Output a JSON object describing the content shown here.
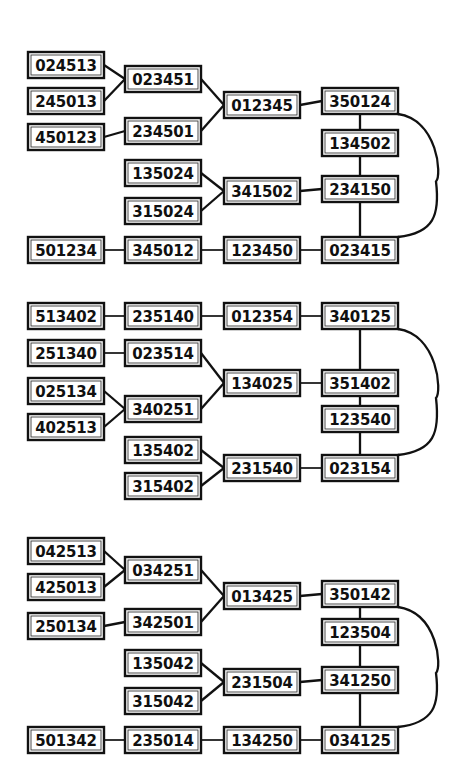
{
  "figure": {
    "diagram_count": 3,
    "canvas": {
      "width": 457,
      "height": 767
    },
    "colors": {
      "background": "#ffffff",
      "box_stroke": "#111111",
      "box_fill": "#ffffff",
      "text": "#101010",
      "edge": "#111111"
    },
    "box_size": {
      "width": 76,
      "height": 26
    },
    "columns": {
      "c1": 28,
      "c2": 125,
      "c3": 224,
      "c4": 322
    }
  },
  "diagrams": [
    {
      "id": "diagram-1",
      "nodes": [
        {
          "id": "d1n1",
          "label": "024513",
          "x": 28,
          "y": 52
        },
        {
          "id": "d1n2",
          "label": "245013",
          "x": 28,
          "y": 88
        },
        {
          "id": "d1n3",
          "label": "450123",
          "x": 28,
          "y": 124
        },
        {
          "id": "d1n4",
          "label": "023451",
          "x": 125,
          "y": 66
        },
        {
          "id": "d1n5",
          "label": "234501",
          "x": 125,
          "y": 118
        },
        {
          "id": "d1n6",
          "label": "012345",
          "x": 224,
          "y": 92
        },
        {
          "id": "d1n7",
          "label": "350124",
          "x": 322,
          "y": 88
        },
        {
          "id": "d1n8",
          "label": "134502",
          "x": 322,
          "y": 130
        },
        {
          "id": "d1n9",
          "label": "135024",
          "x": 125,
          "y": 160
        },
        {
          "id": "d1n10",
          "label": "315024",
          "x": 125,
          "y": 198
        },
        {
          "id": "d1n11",
          "label": "341502",
          "x": 224,
          "y": 178
        },
        {
          "id": "d1n12",
          "label": "234150",
          "x": 322,
          "y": 176
        },
        {
          "id": "d1n13",
          "label": "501234",
          "x": 28,
          "y": 237
        },
        {
          "id": "d1n14",
          "label": "345012",
          "x": 125,
          "y": 237
        },
        {
          "id": "d1n15",
          "label": "123450",
          "x": 224,
          "y": 237
        },
        {
          "id": "d1n16",
          "label": "023415",
          "x": 322,
          "y": 237
        }
      ],
      "edges": [
        {
          "from": "d1n1",
          "to": "d1n4",
          "kind": "straight"
        },
        {
          "from": "d1n2",
          "to": "d1n4",
          "kind": "straight"
        },
        {
          "from": "d1n3",
          "to": "d1n5",
          "kind": "straight"
        },
        {
          "from": "d1n4",
          "to": "d1n6",
          "kind": "straight"
        },
        {
          "from": "d1n5",
          "to": "d1n6",
          "kind": "straight"
        },
        {
          "from": "d1n6",
          "to": "d1n7",
          "kind": "straight"
        },
        {
          "from": "d1n7",
          "to": "d1n8",
          "kind": "vertical"
        },
        {
          "from": "d1n8",
          "to": "d1n12",
          "kind": "vertical"
        },
        {
          "from": "d1n9",
          "to": "d1n11",
          "kind": "straight"
        },
        {
          "from": "d1n10",
          "to": "d1n11",
          "kind": "straight"
        },
        {
          "from": "d1n11",
          "to": "d1n12",
          "kind": "straight"
        },
        {
          "from": "d1n12",
          "to": "d1n16",
          "kind": "vertical"
        },
        {
          "from": "d1n13",
          "to": "d1n14",
          "kind": "straight"
        },
        {
          "from": "d1n14",
          "to": "d1n15",
          "kind": "straight"
        },
        {
          "from": "d1n15",
          "to": "d1n16",
          "kind": "straight"
        },
        {
          "from": "d1n7",
          "to": "d1n16",
          "kind": "arc",
          "bulge": 40
        }
      ]
    },
    {
      "id": "diagram-2",
      "nodes": [
        {
          "id": "d2n1",
          "label": "513402",
          "x": 28,
          "y": 303
        },
        {
          "id": "d2n2",
          "label": "235140",
          "x": 125,
          "y": 303
        },
        {
          "id": "d2n3",
          "label": "012354",
          "x": 224,
          "y": 303
        },
        {
          "id": "d2n4",
          "label": "340125",
          "x": 322,
          "y": 303
        },
        {
          "id": "d2n5",
          "label": "251340",
          "x": 28,
          "y": 340
        },
        {
          "id": "d2n6",
          "label": "023514",
          "x": 125,
          "y": 340
        },
        {
          "id": "d2n7",
          "label": "025134",
          "x": 28,
          "y": 378
        },
        {
          "id": "d2n8",
          "label": "402513",
          "x": 28,
          "y": 414
        },
        {
          "id": "d2n9",
          "label": "340251",
          "x": 125,
          "y": 396
        },
        {
          "id": "d2n10",
          "label": "134025",
          "x": 224,
          "y": 370
        },
        {
          "id": "d2n11",
          "label": "351402",
          "x": 322,
          "y": 370
        },
        {
          "id": "d2n12",
          "label": "123540",
          "x": 322,
          "y": 406
        },
        {
          "id": "d2n13",
          "label": "135402",
          "x": 125,
          "y": 437
        },
        {
          "id": "d2n14",
          "label": "315402",
          "x": 125,
          "y": 473
        },
        {
          "id": "d2n15",
          "label": "231540",
          "x": 224,
          "y": 455
        },
        {
          "id": "d2n16",
          "label": "023154",
          "x": 322,
          "y": 455
        }
      ],
      "edges": [
        {
          "from": "d2n1",
          "to": "d2n2",
          "kind": "straight"
        },
        {
          "from": "d2n2",
          "to": "d2n3",
          "kind": "straight"
        },
        {
          "from": "d2n3",
          "to": "d2n4",
          "kind": "straight"
        },
        {
          "from": "d2n4",
          "to": "d2n11",
          "kind": "vertical"
        },
        {
          "from": "d2n5",
          "to": "d2n6",
          "kind": "straight"
        },
        {
          "from": "d2n6",
          "to": "d2n10",
          "kind": "straight"
        },
        {
          "from": "d2n7",
          "to": "d2n9",
          "kind": "straight"
        },
        {
          "from": "d2n8",
          "to": "d2n9",
          "kind": "straight"
        },
        {
          "from": "d2n9",
          "to": "d2n10",
          "kind": "straight"
        },
        {
          "from": "d2n10",
          "to": "d2n11",
          "kind": "straight"
        },
        {
          "from": "d2n11",
          "to": "d2n12",
          "kind": "vertical"
        },
        {
          "from": "d2n12",
          "to": "d2n16",
          "kind": "vertical"
        },
        {
          "from": "d2n13",
          "to": "d2n15",
          "kind": "straight"
        },
        {
          "from": "d2n14",
          "to": "d2n15",
          "kind": "straight"
        },
        {
          "from": "d2n15",
          "to": "d2n16",
          "kind": "straight"
        },
        {
          "from": "d2n4",
          "to": "d2n16",
          "kind": "arc",
          "bulge": 40
        }
      ]
    },
    {
      "id": "diagram-3",
      "nodes": [
        {
          "id": "d3n1",
          "label": "042513",
          "x": 28,
          "y": 538
        },
        {
          "id": "d3n2",
          "label": "425013",
          "x": 28,
          "y": 574
        },
        {
          "id": "d3n3",
          "label": "250134",
          "x": 28,
          "y": 613
        },
        {
          "id": "d3n4",
          "label": "034251",
          "x": 125,
          "y": 557
        },
        {
          "id": "d3n5",
          "label": "342501",
          "x": 125,
          "y": 609
        },
        {
          "id": "d3n6",
          "label": "013425",
          "x": 224,
          "y": 583
        },
        {
          "id": "d3n7",
          "label": "350142",
          "x": 322,
          "y": 581
        },
        {
          "id": "d3n8",
          "label": "123504",
          "x": 322,
          "y": 619
        },
        {
          "id": "d3n9",
          "label": "135042",
          "x": 125,
          "y": 650
        },
        {
          "id": "d3n10",
          "label": "315042",
          "x": 125,
          "y": 688
        },
        {
          "id": "d3n11",
          "label": "231504",
          "x": 224,
          "y": 669
        },
        {
          "id": "d3n12",
          "label": "341250",
          "x": 322,
          "y": 667
        },
        {
          "id": "d3n13",
          "label": "501342",
          "x": 28,
          "y": 727
        },
        {
          "id": "d3n14",
          "label": "235014",
          "x": 125,
          "y": 727
        },
        {
          "id": "d3n15",
          "label": "134250",
          "x": 224,
          "y": 727
        },
        {
          "id": "d3n16",
          "label": "034125",
          "x": 322,
          "y": 727
        }
      ],
      "edges": [
        {
          "from": "d3n1",
          "to": "d3n4",
          "kind": "straight"
        },
        {
          "from": "d3n2",
          "to": "d3n4",
          "kind": "straight"
        },
        {
          "from": "d3n3",
          "to": "d3n5",
          "kind": "straight"
        },
        {
          "from": "d3n4",
          "to": "d3n6",
          "kind": "straight"
        },
        {
          "from": "d3n5",
          "to": "d3n6",
          "kind": "straight"
        },
        {
          "from": "d3n6",
          "to": "d3n7",
          "kind": "straight"
        },
        {
          "from": "d3n7",
          "to": "d3n8",
          "kind": "vertical"
        },
        {
          "from": "d3n8",
          "to": "d3n12",
          "kind": "vertical"
        },
        {
          "from": "d3n9",
          "to": "d3n11",
          "kind": "straight"
        },
        {
          "from": "d3n10",
          "to": "d3n11",
          "kind": "straight"
        },
        {
          "from": "d3n11",
          "to": "d3n12",
          "kind": "straight"
        },
        {
          "from": "d3n12",
          "to": "d3n16",
          "kind": "vertical"
        },
        {
          "from": "d3n13",
          "to": "d3n14",
          "kind": "straight"
        },
        {
          "from": "d3n14",
          "to": "d3n15",
          "kind": "straight"
        },
        {
          "from": "d3n15",
          "to": "d3n16",
          "kind": "straight"
        },
        {
          "from": "d3n7",
          "to": "d3n16",
          "kind": "arc",
          "bulge": 40
        }
      ]
    }
  ]
}
